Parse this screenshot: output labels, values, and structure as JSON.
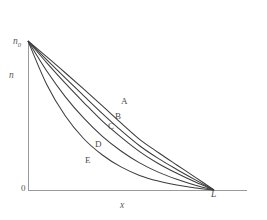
{
  "figure": {
    "background_color": "#ffffff",
    "axis_color": "#9a9a9a",
    "curve_color": "#3c3c3c",
    "label_color": "#5a5a5a"
  },
  "axes": {
    "y_axis_title": "n",
    "x_axis_title": "x",
    "origin_label": "0",
    "y_top_label_main": "n",
    "y_top_label_sub": "0",
    "x_end_label": "L"
  },
  "curve_labels": {
    "A": "A",
    "B": "B",
    "C": "C",
    "D": "D",
    "E": "E"
  },
  "chart_data": {
    "type": "line",
    "title": "",
    "subtitle": "",
    "xlabel": "x",
    "ylabel": "n",
    "grid": false,
    "legend_position": "inline-curve-labels",
    "xlim": [
      0,
      1
    ],
    "ylim": [
      0,
      1
    ],
    "x_tick_labels": [
      "0",
      "L"
    ],
    "y_tick_labels": [
      "0",
      "n0"
    ],
    "annotations": [
      "n0 marks the initial value on the n axis",
      "L marks the end point on the x axis",
      "All five curves start at (0, n0) and terminate at (L, 0)"
    ],
    "x": [
      0,
      0.1,
      0.2,
      0.3,
      0.4,
      0.5,
      0.6,
      0.7,
      0.8,
      0.9,
      1.0
    ],
    "series": [
      {
        "name": "A",
        "values": [
          1.0,
          0.895,
          0.787,
          0.677,
          0.565,
          0.45,
          0.34,
          0.252,
          0.168,
          0.085,
          0.0
        ]
      },
      {
        "name": "B",
        "values": [
          1.0,
          0.875,
          0.752,
          0.632,
          0.513,
          0.4,
          0.297,
          0.212,
          0.138,
          0.068,
          0.0
        ]
      },
      {
        "name": "C",
        "values": [
          1.0,
          0.855,
          0.717,
          0.587,
          0.462,
          0.355,
          0.258,
          0.178,
          0.112,
          0.053,
          0.0
        ]
      },
      {
        "name": "D",
        "values": [
          1.0,
          0.8,
          0.627,
          0.482,
          0.36,
          0.262,
          0.182,
          0.12,
          0.072,
          0.032,
          0.0
        ]
      },
      {
        "name": "E",
        "values": [
          1.0,
          0.71,
          0.498,
          0.344,
          0.235,
          0.155,
          0.098,
          0.06,
          0.033,
          0.013,
          0.0
        ]
      }
    ]
  },
  "geometry": {
    "origin_px": {
      "x": 28,
      "y": 190
    },
    "y_top_px": 41,
    "x_axis_right_px": 247,
    "L_px": 214
  }
}
